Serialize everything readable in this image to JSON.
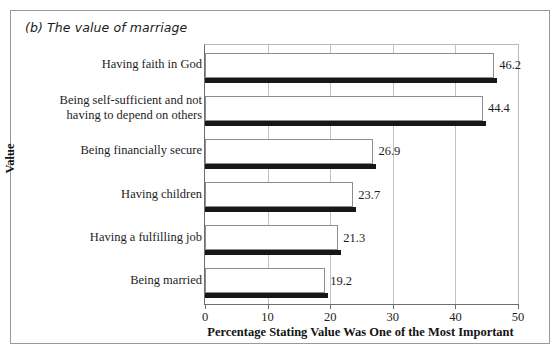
{
  "figure": {
    "title": "(b) The value of marriage"
  },
  "chart_data": {
    "type": "bar",
    "orientation": "horizontal",
    "title": "(b) The value of marriage",
    "xlabel": "Percentage Stating Value Was One of the Most Important",
    "ylabel": "Value",
    "xlim": [
      0,
      50
    ],
    "xticks": [
      "0",
      "10",
      "20",
      "30",
      "40",
      "50"
    ],
    "xtick_values": [
      0,
      10,
      20,
      30,
      40,
      50
    ],
    "grid": "vertical",
    "legend": "none",
    "categories": [
      "Having faith in God",
      "Being self-sufficient and not having to depend on others",
      "Being financially secure",
      "Having children",
      "Having a fulfilling job",
      "Being married"
    ],
    "category_lines": [
      [
        "Having faith in God"
      ],
      [
        "Being self-sufficient and not",
        "having to depend on others"
      ],
      [
        "Being financially secure"
      ],
      [
        "Having children"
      ],
      [
        "Having a fulfilling job"
      ],
      [
        "Being married"
      ]
    ],
    "values": [
      46.2,
      44.4,
      26.9,
      23.7,
      21.3,
      19.2
    ],
    "value_labels": [
      "46.2",
      "44.4",
      "26.9",
      "23.7",
      "21.3",
      "19.2"
    ],
    "colors": {
      "bar_fill": "#ffffff",
      "bar_outline": "#8d8d8d",
      "bar_shadow": "#171717",
      "gridline": "#c2c2c2",
      "axis": "#6e6e6e",
      "text": "#1d1d1d",
      "frame": "#9a9a9a"
    }
  }
}
